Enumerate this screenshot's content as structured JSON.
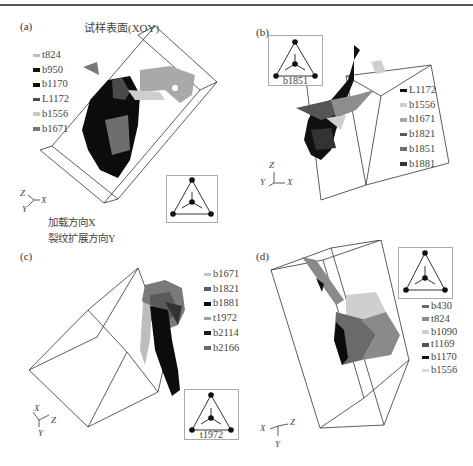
{
  "figure": {
    "panels": [
      {
        "label": "(a)",
        "surface_label": "试样表面(XOY)",
        "legend": [
          {
            "name": "t824",
            "color": "#bdbdbd"
          },
          {
            "name": "b950",
            "color": "#111111"
          },
          {
            "name": "b1170",
            "color": "#0a0a0a"
          },
          {
            "name": "L1172",
            "color": "#4a4a4a"
          },
          {
            "name": "b1556",
            "color": "#c8c8c8"
          },
          {
            "name": "b1671",
            "color": "#7a7a7a"
          }
        ],
        "inset_caption": "",
        "axes": {
          "a": "Z",
          "b": "X",
          "c": "Y"
        },
        "notes": [
          "加载方向X",
          "裂纹扩展方向Y"
        ]
      },
      {
        "label": "(b)",
        "legend": [
          {
            "name": "L1172",
            "color": "#111111"
          },
          {
            "name": "b1556",
            "color": "#cfcfcf"
          },
          {
            "name": "b1671",
            "color": "#a8a8a8"
          },
          {
            "name": "b1821",
            "color": "#5a5a5a"
          },
          {
            "name": "b1851",
            "color": "#6e6e6e"
          },
          {
            "name": "b1881",
            "color": "#333333"
          }
        ],
        "inset_caption": "b1851",
        "axes": {
          "a": "Z",
          "b": "X",
          "c": "Y"
        }
      },
      {
        "label": "(c)",
        "legend": [
          {
            "name": "b1671",
            "color": "#c4c4c4"
          },
          {
            "name": "b1821",
            "color": "#5e5e5e"
          },
          {
            "name": "b1881",
            "color": "#0e0e0e"
          },
          {
            "name": "t1972",
            "color": "#a0a0a0"
          },
          {
            "name": "b2114",
            "color": "#1a1a1a"
          },
          {
            "name": "b2166",
            "color": "#6a6a6a"
          }
        ],
        "inset_caption": "t1972",
        "axes": {
          "a": "X",
          "b": "Z",
          "c": "Y"
        }
      },
      {
        "label": "(d)",
        "legend": [
          {
            "name": "b430",
            "color": "#6a6a6a"
          },
          {
            "name": "t824",
            "color": "#8a8a8a"
          },
          {
            "name": "b1090",
            "color": "#cfcfcf"
          },
          {
            "name": "t1169",
            "color": "#555555"
          },
          {
            "name": "b1170",
            "color": "#111111"
          },
          {
            "name": "b1556",
            "color": "#d8d8d8"
          }
        ],
        "inset_caption": "",
        "axes": {
          "a": "X",
          "b": "Z",
          "c": "Y"
        }
      }
    ]
  }
}
